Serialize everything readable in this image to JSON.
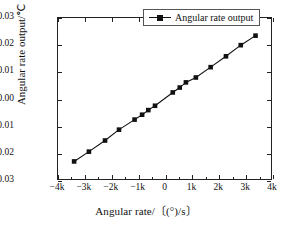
{
  "chart_data": {
    "type": "line",
    "title": "",
    "xlabel": "Angular rate/〔(°)/s〕",
    "ylabel": "Angular rate output/℃",
    "xlim": [
      -4000,
      4000
    ],
    "ylim": [
      -0.03,
      0.03
    ],
    "grid": false,
    "legend_position": "top-right",
    "xticks": [
      -4000,
      -3000,
      -2000,
      -1000,
      0,
      1000,
      2000,
      3000,
      4000
    ],
    "xticklabels": [
      "−4k",
      "−3k",
      "−2k",
      "−1k",
      "0",
      "1k",
      "2k",
      "3k",
      "4k"
    ],
    "yticks": [
      -0.03,
      -0.02,
      -0.01,
      0.0,
      0.01,
      0.02,
      0.03
    ],
    "yticklabels": [
      "−0.03",
      "−0.02",
      "−0.01",
      "0.00",
      "0.01",
      "0.02",
      "0.03"
    ],
    "series": [
      {
        "name": "Angular rate output",
        "marker": "square",
        "color": "#111111",
        "x": [
          -3400,
          -2850,
          -2250,
          -1730,
          -1150,
          -870,
          -640,
          -390,
          270,
          530,
          760,
          1130,
          1680,
          2250,
          2800,
          3350
        ],
        "y": [
          -0.0228,
          -0.0192,
          -0.0151,
          -0.0111,
          -0.0074,
          -0.0056,
          -0.0039,
          -0.0023,
          0.0026,
          0.0044,
          0.0063,
          0.0081,
          0.0119,
          0.0159,
          0.02,
          0.0235
        ]
      }
    ]
  },
  "legend": {
    "entries": [
      {
        "label": "Angular rate output",
        "marker_icon": "square-marker-icon"
      }
    ]
  },
  "axes": {
    "x_title": "Angular rate/〔(°)/s〕",
    "y_title": "Angular rate output/℃"
  }
}
